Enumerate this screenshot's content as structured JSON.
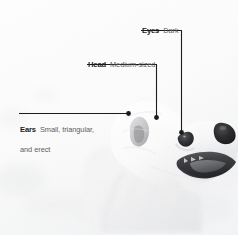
{
  "figure": {
    "background_color": "#fdfdfd",
    "leader_line_color": "#1b1b1b",
    "term_color": "#1b1b1b",
    "description_color": "#5d5d5d"
  },
  "callouts": [
    {
      "id": "eyes",
      "term": "Eyes",
      "description": "Dark",
      "anchor_label": "dog-eye"
    },
    {
      "id": "head",
      "term": "Head",
      "description": "Medium-sized",
      "anchor_label": "dog-head"
    },
    {
      "id": "ears",
      "term": "Ears",
      "description": "Small, triangular, and erect",
      "description_line_1": "Small, triangular,",
      "description_line_2": "and erect",
      "anchor_label": "dog-ear"
    }
  ]
}
